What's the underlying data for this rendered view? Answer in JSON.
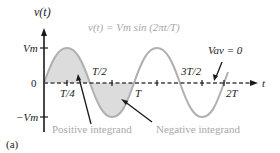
{
  "figure": {
    "panel_label": "(a)",
    "y_axis_label": "v(t)",
    "x_axis_label": "t",
    "equation": "v(t) = Vm sin (2πt/T)",
    "average_label": "Vav = 0",
    "y_ticks": [
      "Vm",
      "0",
      "−Vm"
    ],
    "x_ticks": [
      "T/4",
      "T/2",
      "T",
      "3T/2",
      "2T"
    ],
    "annotations": {
      "positive": "Positive integrand",
      "negative": "Negative integrand"
    },
    "colors": {
      "curve": "#b0b0b0",
      "fill": "#dcdcdc",
      "axis": "#1a1a1a",
      "annotation_text": "#a8a8a8"
    }
  }
}
